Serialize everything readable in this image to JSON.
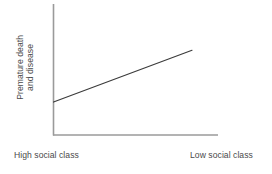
{
  "chart_data": {
    "type": "line",
    "title": "",
    "subtitle": "",
    "xlabel": "",
    "ylabel": "Premature death and disease",
    "ylabel_lines": [
      "Premature death",
      "and disease"
    ],
    "x_tick_labels": [
      "High social class",
      "Low social class"
    ],
    "y_tick_labels": [],
    "grid": false,
    "legend": false,
    "legend_position": "none",
    "xlim": [
      0,
      1
    ],
    "ylim": [
      0,
      1
    ],
    "axis_color": "#9a9a9a",
    "line_color": "#3b3b3b",
    "text_color": "#4a4a4a",
    "background_color": "#ffffff",
    "series": [
      {
        "name": "Premature death and disease gradient",
        "x": [
          0,
          1
        ],
        "values": [
          0.24,
          0.72
        ],
        "annotation": "Rising straight trend line from high social class to low social class"
      }
    ]
  },
  "labels": {
    "y_axis_line_1": "Premature death",
    "y_axis_line_2": "and disease",
    "x_axis_left": "High social class",
    "x_axis_right": "Low social class"
  }
}
